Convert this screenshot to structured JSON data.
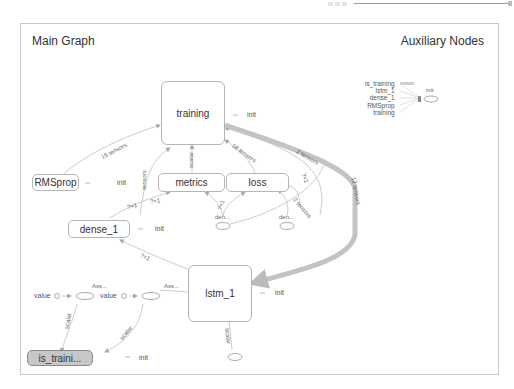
{
  "toolbar": {
    "slider_dots_icon": "grip-dots-icon",
    "slider": "zoom-slider"
  },
  "panel": {
    "main_title": "Main Graph",
    "aux_title": "Auxiliary Nodes"
  },
  "nodes": {
    "training": {
      "label": "training",
      "init": "init"
    },
    "rmsprop": {
      "label": "RMSprop",
      "init": "init"
    },
    "metrics": {
      "label": "metrics"
    },
    "loss": {
      "label": "loss"
    },
    "dense_1": {
      "label": "dense_1",
      "init": "init"
    },
    "lstm_1": {
      "label": "lstm_1",
      "init": "init"
    },
    "is_training": {
      "label": "is_traini...",
      "init": "init"
    },
    "den_a": {
      "label": "den..."
    },
    "den_b": {
      "label": "den..."
    },
    "assign_a": {
      "label": "Ass...",
      "input": "value"
    },
    "assign_b": {
      "label": "Ass...",
      "input": "value"
    }
  },
  "edges": {
    "rmsprop_training": "15 tensors",
    "metrics_training": "scalar",
    "loss_training": "18 tensors",
    "dense_training": "tensors",
    "lstm_training_a": "2 tensors",
    "lstm_training_thick": "12 tensors",
    "lstm_loss": "?×1",
    "lstm_den": "2 tensors",
    "den_loss": "?×1",
    "dense_metrics_a": "?×1",
    "dense_metrics_b": "?×1",
    "lstm_dense": "?×1",
    "assign_a_is": "scalar",
    "assign_b_is": "scalar",
    "lstm_bottom": "scalar"
  },
  "auxiliary": {
    "items": [
      "is_training",
      "lstm_1",
      "dense_1",
      "RMSprop",
      "training"
    ],
    "init": "init"
  }
}
